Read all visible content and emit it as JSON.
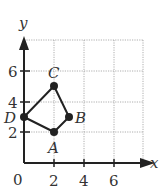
{
  "diagram": {
    "type": "coordinate-plane",
    "x_axis": {
      "label": "x",
      "ticks": [
        "2",
        "4",
        "6"
      ],
      "origin_label": "0"
    },
    "y_axis": {
      "label": "y",
      "ticks": [
        "2",
        "4",
        "6"
      ]
    },
    "grid": {
      "xmin": 0,
      "xmax": 8,
      "ymin": 0,
      "ymax": 8,
      "step": 2
    },
    "points": [
      {
        "name": "A",
        "x": 2,
        "y": 2
      },
      {
        "name": "B",
        "x": 3,
        "y": 3
      },
      {
        "name": "C",
        "x": 2,
        "y": 5
      },
      {
        "name": "D",
        "x": 0,
        "y": 3
      }
    ],
    "polygon": [
      "A",
      "B",
      "C",
      "D"
    ],
    "colors": {
      "line": "#222222",
      "grid": "#9a9a9a",
      "text": "#333333"
    }
  }
}
